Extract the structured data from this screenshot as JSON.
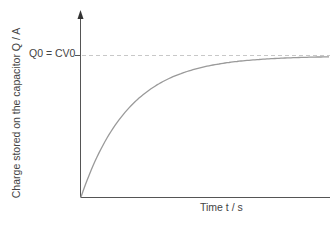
{
  "chart_data": {
    "type": "line",
    "title": "",
    "xlabel": "Time t / s",
    "ylabel": "Charge stored on the capacitor Q / A",
    "grid": false,
    "legend": null,
    "annotations": [
      {
        "label": "Q0 = CV0",
        "type": "horizontal-dashed-asymptote",
        "y_fraction_of_axis": 0.77
      }
    ],
    "series": [
      {
        "name": "Charging curve Q = Q0(1 - e^(-t/RC))",
        "x": [
          0,
          0.1,
          0.2,
          0.3,
          0.4,
          0.5,
          0.6,
          0.7,
          0.8,
          0.9,
          1.0
        ],
        "y_fraction_of_Q0": [
          0,
          0.45,
          0.7,
          0.84,
          0.92,
          0.96,
          0.985,
          0.995,
          1.0,
          1.0,
          1.0
        ]
      }
    ],
    "xlim": [
      0,
      1
    ],
    "ylim": [
      0,
      1.3
    ]
  },
  "labels": {
    "y_axis_text": "Charge stored on the capacitor Q / A",
    "x_axis_text": "Time t / s",
    "q0_text": "Q0 = CV0"
  },
  "colors": {
    "axis": "#555555",
    "curve": "#9a9a9a",
    "dashed": "#c8c8c8",
    "text": "#444444"
  }
}
